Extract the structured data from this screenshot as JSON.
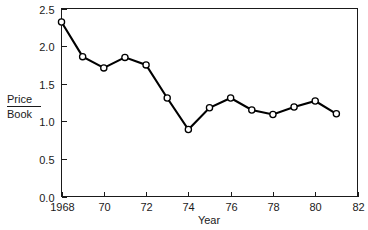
{
  "chart_data": {
    "type": "line",
    "title": "",
    "xlabel": "Year",
    "ylabel": "Price/Book",
    "ylabel_numerator": "Price",
    "ylabel_denominator": "Book",
    "x": [
      1968,
      1969,
      1970,
      1971,
      1972,
      1973,
      1974,
      1975,
      1976,
      1977,
      1978,
      1979,
      1980,
      1981
    ],
    "values": [
      2.32,
      1.86,
      1.71,
      1.85,
      1.75,
      1.31,
      0.89,
      1.18,
      1.31,
      1.15,
      1.09,
      1.19,
      1.27,
      1.1
    ],
    "series": [
      {
        "name": "Price/Book",
        "values": [
          2.32,
          1.86,
          1.71,
          1.85,
          1.75,
          1.31,
          0.89,
          1.18,
          1.31,
          1.15,
          1.09,
          1.19,
          1.27,
          1.1
        ]
      }
    ],
    "xlim": [
      1968,
      1982
    ],
    "ylim": [
      0.0,
      2.5
    ],
    "grid": false,
    "legend": false,
    "legend_position": "none",
    "marker": "open-circle",
    "line_color": "#000000",
    "marker_fill": "#ffffff",
    "background": "#ffffff"
  },
  "axes": {
    "x": {
      "label": "Year",
      "tick_values": [
        1968,
        1970,
        1972,
        1974,
        1976,
        1978,
        1980,
        1982
      ],
      "tick_labels": [
        "1968",
        "70",
        "72",
        "74",
        "76",
        "78",
        "80",
        "82"
      ],
      "min": 1968,
      "max": 1982
    },
    "y": {
      "label_line1": "Price",
      "label_line2": "Book",
      "tick_values": [
        0.0,
        0.5,
        1.0,
        1.5,
        2.0,
        2.5
      ],
      "tick_labels": [
        "0.0",
        "0.5",
        "1.0",
        "1.5",
        "2.0",
        "2.5"
      ],
      "min": 0.0,
      "max": 2.5
    }
  },
  "colors": {
    "line": "#000000",
    "marker_fill": "#ffffff",
    "axis": "#1a1a1a",
    "text": "#1a1a1a",
    "background": "#ffffff"
  }
}
